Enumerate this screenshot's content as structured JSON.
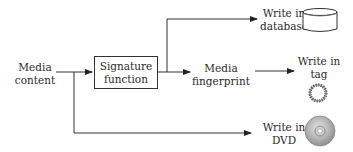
{
  "diagram": {
    "nodes": {
      "media_content": {
        "line1": "Media",
        "line2": "content"
      },
      "signature_function": {
        "line1": "Signature",
        "line2": "function"
      },
      "media_fingerprint": {
        "line1": "Media",
        "line2": "fingerprint"
      },
      "write_database": {
        "line1": "Write in",
        "line2": "database",
        "icon": "database-icon"
      },
      "write_tag": {
        "line1": "Write in",
        "line2": "tag",
        "icon": "tag-ring-icon"
      },
      "write_dvd": {
        "line1": "Write in",
        "line2": "DVD",
        "icon": "dvd-disc-icon"
      }
    },
    "edges": [
      {
        "from": "media_content",
        "to": "signature_function"
      },
      {
        "from": "signature_function",
        "to": "write_database"
      },
      {
        "from": "signature_function",
        "to": "media_fingerprint"
      },
      {
        "from": "media_fingerprint",
        "to": "write_tag"
      },
      {
        "from": "media_content",
        "to": "write_dvd"
      }
    ],
    "colors": {
      "line": "#333333",
      "text": "#2a2a2a",
      "disc": "#a8a8a8"
    }
  }
}
